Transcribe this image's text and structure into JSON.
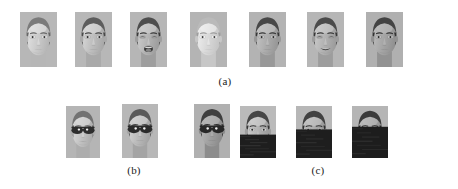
{
  "figure": {
    "background_color": "#ffffff",
    "panels": [
      {
        "id": "a",
        "caption": "(a)",
        "caption_x": 225,
        "caption_y": 75,
        "description": "facial expression variations",
        "row_top": 12,
        "images": [
          {
            "name": "face-expression-1",
            "label": "neutral-dim",
            "x": 20,
            "y": 12,
            "w": 37,
            "h": 55,
            "skin": "#cfcfcf",
            "hair": "#6f6f6f",
            "mouth": "closed",
            "eyes": "open",
            "brightness": 1.1,
            "contrast": 0.8,
            "occlusion": "none",
            "glasses": false
          },
          {
            "name": "face-expression-2",
            "label": "neutral",
            "x": 75,
            "y": 12,
            "w": 37,
            "h": 55,
            "skin": "#c4c4c4",
            "hair": "#5d5d5d",
            "mouth": "closed",
            "eyes": "open",
            "brightness": 1.0,
            "contrast": 1.0,
            "occlusion": "none",
            "glasses": false
          },
          {
            "name": "face-expression-3",
            "label": "tongue-out",
            "x": 130,
            "y": 12,
            "w": 37,
            "h": 55,
            "skin": "#bdbdbd",
            "hair": "#555555",
            "mouth": "open",
            "eyes": "squint",
            "brightness": 0.96,
            "contrast": 1.08,
            "occlusion": "none",
            "glasses": false
          },
          {
            "name": "face-expression-4",
            "label": "overexposed",
            "x": 190,
            "y": 12,
            "w": 37,
            "h": 55,
            "skin": "#e6e6e6",
            "hair": "#b4b4b4",
            "mouth": "closed",
            "eyes": "open",
            "brightness": 1.3,
            "contrast": 0.55,
            "occlusion": "none",
            "glasses": false
          },
          {
            "name": "face-expression-5",
            "label": "neutral-frontal",
            "x": 249,
            "y": 12,
            "w": 37,
            "h": 55,
            "skin": "#b9b9b9",
            "hair": "#4f4f4f",
            "mouth": "closed",
            "eyes": "open",
            "brightness": 0.95,
            "contrast": 1.05,
            "occlusion": "none",
            "glasses": false
          },
          {
            "name": "face-expression-6",
            "label": "smiling-teeth",
            "x": 307,
            "y": 12,
            "w": 37,
            "h": 55,
            "skin": "#bbbbbb",
            "hair": "#505050",
            "mouth": "smile",
            "eyes": "squint",
            "brightness": 0.97,
            "contrast": 1.05,
            "occlusion": "none",
            "glasses": false
          },
          {
            "name": "face-expression-7",
            "label": "neutral-shadowed",
            "x": 366,
            "y": 12,
            "w": 37,
            "h": 55,
            "skin": "#b5b5b5",
            "hair": "#4b4b4b",
            "mouth": "closed",
            "eyes": "open",
            "brightness": 0.93,
            "contrast": 1.05,
            "occlusion": "none",
            "glasses": false
          }
        ]
      },
      {
        "id": "b",
        "caption": "(b)",
        "caption_x": 134,
        "caption_y": 164,
        "description": "faces occluded by sunglasses",
        "row_top": 104,
        "images": [
          {
            "name": "face-sunglasses-1",
            "label": "sunglasses-dim",
            "x": 66,
            "y": 106,
            "w": 34,
            "h": 52,
            "skin": "#c9c9c9",
            "hair": "#6a6a6a",
            "mouth": "closed",
            "eyes": "hidden",
            "brightness": 1.05,
            "contrast": 0.85,
            "occlusion": "none",
            "glasses": true
          },
          {
            "name": "face-sunglasses-2",
            "label": "sunglasses",
            "x": 122,
            "y": 104,
            "w": 36,
            "h": 54,
            "skin": "#bfbfbf",
            "hair": "#5a5a5a",
            "mouth": "closed",
            "eyes": "hidden",
            "brightness": 1.0,
            "contrast": 1.0,
            "occlusion": "none",
            "glasses": true
          },
          {
            "name": "face-sunglasses-3",
            "label": "sunglasses-dark",
            "x": 194,
            "y": 104,
            "w": 36,
            "h": 54,
            "skin": "#b0b0b0",
            "hair": "#4a4a4a",
            "mouth": "closed",
            "eyes": "hidden",
            "brightness": 0.92,
            "contrast": 1.08,
            "occlusion": "none",
            "glasses": true
          }
        ]
      },
      {
        "id": "c",
        "caption": "(c)",
        "caption_x": 318,
        "caption_y": 164,
        "description": "faces with progressive lower-face occlusion",
        "row_top": 104,
        "images": [
          {
            "name": "face-occluded-1",
            "label": "occlusion-45",
            "x": 240,
            "y": 106,
            "w": 36,
            "h": 52,
            "skin": "#b8b8b8",
            "hair": "#4d4d4d",
            "mouth": "closed",
            "eyes": "open",
            "brightness": 0.98,
            "contrast": 1.1,
            "occlusion": "bottom",
            "occlusion_fraction": 0.45,
            "glasses": false
          },
          {
            "name": "face-occluded-2",
            "label": "occlusion-55",
            "x": 296,
            "y": 106,
            "w": 36,
            "h": 52,
            "skin": "#b4b4b4",
            "hair": "#4a4a4a",
            "mouth": "closed",
            "eyes": "open",
            "brightness": 0.96,
            "contrast": 1.1,
            "occlusion": "bottom",
            "occlusion_fraction": 0.55,
            "glasses": false
          },
          {
            "name": "face-occluded-3",
            "label": "occlusion-60",
            "x": 352,
            "y": 106,
            "w": 36,
            "h": 52,
            "skin": "#b0b0b0",
            "hair": "#474747",
            "mouth": "closed",
            "eyes": "open",
            "brightness": 0.94,
            "contrast": 1.12,
            "occlusion": "bottom",
            "occlusion_fraction": 0.6,
            "glasses": false
          }
        ]
      }
    ]
  }
}
